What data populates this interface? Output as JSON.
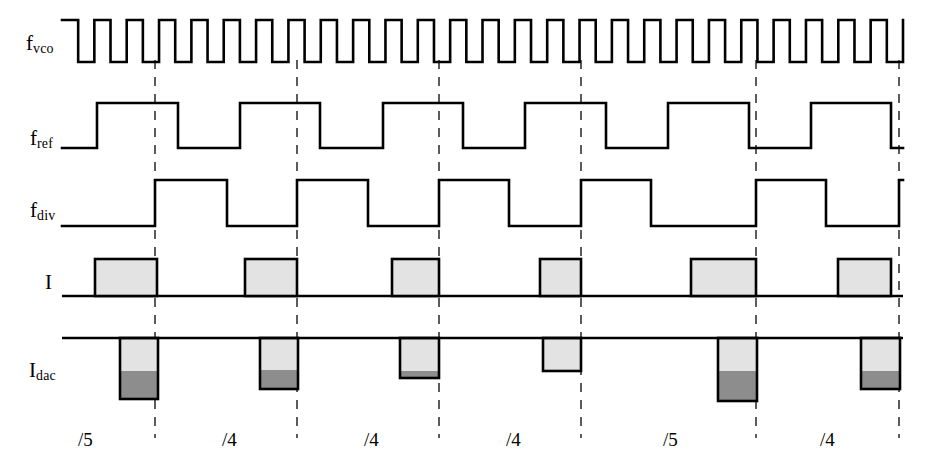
{
  "figure": {
    "type": "timing-diagram",
    "width": 936,
    "height": 454,
    "background": "#ffffff",
    "line_color": "#000000",
    "dash_color": "#4a4a4a",
    "fill_light": "#e3e3e3",
    "fill_dark": "#8d8d8d"
  },
  "signals": [
    {
      "id": "fvco",
      "label_main": "f",
      "label_sub": "vco",
      "label_x": 26,
      "label_y": 33,
      "row_top": 20,
      "row_bottom": 72
    },
    {
      "id": "fref",
      "label_main": "f",
      "label_sub": "ref",
      "label_x": 30,
      "label_y": 128,
      "row_top": 103,
      "row_bottom": 150
    },
    {
      "id": "fdiv",
      "label_main": "f",
      "label_sub": "div",
      "label_x": 30,
      "label_y": 200,
      "row_top": 180,
      "row_bottom": 227
    },
    {
      "id": "i",
      "label_main": "I",
      "label_sub": "",
      "label_x": 45,
      "label_y": 272,
      "row_top": 259,
      "row_bottom": 296
    },
    {
      "id": "idac",
      "label_main": "I",
      "label_sub": "dac",
      "label_x": 29,
      "label_y": 360,
      "row_top": 338,
      "row_bottom": 400
    }
  ],
  "markers": {
    "label": "reference-edge-markers",
    "x_positions": [
      155,
      297,
      439,
      581,
      756,
      899
    ],
    "y_top": 60,
    "y_bottom": 438
  },
  "chart_data": {
    "type": "timing",
    "xlabel": "",
    "ylabel": "",
    "x_range": [
      60,
      905
    ],
    "traces": [
      {
        "name": "f_vco",
        "kind": "digital-clock",
        "y_high": 20,
        "y_low": 62,
        "x_start": 62,
        "x_end": 903,
        "cycles": 26,
        "duty": 0.5,
        "start_level": "high"
      },
      {
        "name": "f_ref",
        "kind": "digital",
        "y_high": 103,
        "y_low": 148,
        "x_start": 62,
        "x_end": 903,
        "edges": [
          {
            "x": 62,
            "level": 0
          },
          {
            "x": 97,
            "level": 1
          },
          {
            "x": 178,
            "level": 0
          },
          {
            "x": 240,
            "level": 1
          },
          {
            "x": 320,
            "level": 0
          },
          {
            "x": 383,
            "level": 1
          },
          {
            "x": 463,
            "level": 0
          },
          {
            "x": 525,
            "level": 1
          },
          {
            "x": 606,
            "level": 0
          },
          {
            "x": 668,
            "level": 1
          },
          {
            "x": 749,
            "level": 0
          },
          {
            "x": 811,
            "level": 1
          },
          {
            "x": 891,
            "level": 0
          },
          {
            "x": 903,
            "level": 0
          }
        ]
      },
      {
        "name": "f_div",
        "kind": "digital",
        "y_high": 180,
        "y_low": 226,
        "x_start": 62,
        "x_end": 903,
        "edges": [
          {
            "x": 62,
            "level": 0
          },
          {
            "x": 155,
            "level": 1
          },
          {
            "x": 227,
            "level": 0
          },
          {
            "x": 297,
            "level": 1
          },
          {
            "x": 368,
            "level": 0
          },
          {
            "x": 439,
            "level": 1
          },
          {
            "x": 509,
            "level": 0
          },
          {
            "x": 581,
            "level": 1
          },
          {
            "x": 651,
            "level": 0
          },
          {
            "x": 756,
            "level": 1
          },
          {
            "x": 826,
            "level": 0
          },
          {
            "x": 899,
            "level": 1
          },
          {
            "x": 903,
            "level": 1
          }
        ]
      },
      {
        "name": "I",
        "kind": "pulse-up",
        "baseline_y": 296,
        "top_y": 259,
        "x_start": 62,
        "x_end": 903,
        "pulses": [
          {
            "x0": 95,
            "x1": 157,
            "width": 62
          },
          {
            "x0": 245,
            "x1": 297,
            "width": 52
          },
          {
            "x0": 392,
            "x1": 439,
            "width": 47
          },
          {
            "x0": 540,
            "x1": 581,
            "width": 41
          },
          {
            "x0": 691,
            "x1": 756,
            "width": 65
          },
          {
            "x0": 838,
            "x1": 891,
            "width": 53
          }
        ]
      },
      {
        "name": "I_dac",
        "kind": "pulse-down-stacked",
        "baseline_y": 338,
        "x_start": 62,
        "x_end": 903,
        "pulses": [
          {
            "x0": 120,
            "x1": 158,
            "bottom_y": 399,
            "dark_top_y": 371
          },
          {
            "x0": 260,
            "x1": 298,
            "bottom_y": 389,
            "dark_top_y": 370
          },
          {
            "x0": 400,
            "x1": 439,
            "bottom_y": 378,
            "dark_top_y": 371
          },
          {
            "x0": 543,
            "x1": 581,
            "bottom_y": 371,
            "dark_top_y": 371
          },
          {
            "x0": 718,
            "x1": 757,
            "bottom_y": 401,
            "dark_top_y": 371
          },
          {
            "x0": 861,
            "x1": 900,
            "bottom_y": 389,
            "dark_top_y": 371
          }
        ]
      }
    ]
  },
  "divider_labels": [
    {
      "text": "/5",
      "x": 78,
      "y": 430
    },
    {
      "text": "/4",
      "x": 222,
      "y": 430
    },
    {
      "text": "/4",
      "x": 364,
      "y": 430
    },
    {
      "text": "/4",
      "x": 506,
      "y": 430
    },
    {
      "text": "/5",
      "x": 663,
      "y": 430
    },
    {
      "text": "/4",
      "x": 820,
      "y": 430
    }
  ]
}
